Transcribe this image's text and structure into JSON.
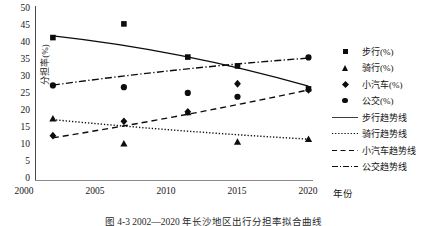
{
  "figure": {
    "caption": "图 4-3   2002—2020 年长沙地区出行分担率拟合曲线"
  },
  "axes": {
    "y_title": "分担率(%)",
    "x_title": "年份",
    "y_ticks": [
      "50",
      "45",
      "40",
      "35",
      "30",
      "25",
      "20",
      "15",
      "10",
      "5",
      "0"
    ],
    "x_ticks": [
      "2000",
      "2005",
      "2010",
      "2015",
      "2020"
    ]
  },
  "legend": {
    "items": [
      {
        "label": "步行(%)",
        "key": "square"
      },
      {
        "label": "骑行(%)",
        "key": "triangle"
      },
      {
        "label": "小汽车(%)",
        "key": "diamond"
      },
      {
        "label": "公交(%)",
        "key": "circle"
      },
      {
        "label": "步行趋势线",
        "key": "solid"
      },
      {
        "label": "骑行趋势线",
        "key": "dotted"
      },
      {
        "label": "小汽车趋势线",
        "key": "dashed"
      },
      {
        "label": "公交趋势线",
        "key": "dashdot"
      }
    ]
  },
  "chart_data": {
    "type": "scatter",
    "title": "",
    "xlabel": "年份",
    "ylabel": "分担率(%)",
    "xlim": [
      2000,
      2021
    ],
    "ylim": [
      0,
      50
    ],
    "grid": false,
    "legend_position": "right",
    "x": [
      2002,
      2007,
      2011.5,
      2015,
      2020
    ],
    "series": [
      {
        "name": "步行(%)",
        "marker": "square",
        "values": [
          41.5,
          45.5,
          35.8,
          33.2,
          26.5
        ]
      },
      {
        "name": "骑行(%)",
        "marker": "triangle",
        "values": [
          17.8,
          10.5,
          19.6,
          11.0,
          11.8
        ]
      },
      {
        "name": "小汽车(%)",
        "marker": "diamond",
        "values": [
          12.8,
          17.0,
          19.8,
          28.0,
          26.2
        ]
      },
      {
        "name": "公交(%)",
        "marker": "circle",
        "values": [
          27.5,
          27.0,
          25.3,
          24.2,
          35.7
        ]
      }
    ],
    "trendlines": [
      {
        "name": "步行趋势线",
        "style": "solid",
        "from": [
          2002,
          42.0
        ],
        "to": [
          2020,
          27.3
        ]
      },
      {
        "name": "骑行趋势线",
        "style": "dotted",
        "from": [
          2002,
          17.5
        ],
        "to": [
          2020,
          11.8
        ]
      },
      {
        "name": "小汽车趋势线",
        "style": "dashed",
        "from": [
          2002,
          12.2
        ],
        "to": [
          2020,
          26.2
        ]
      },
      {
        "name": "公交趋势线",
        "style": "dashdot",
        "from": [
          2002,
          27.6
        ],
        "to": [
          2020,
          35.5
        ]
      }
    ]
  }
}
